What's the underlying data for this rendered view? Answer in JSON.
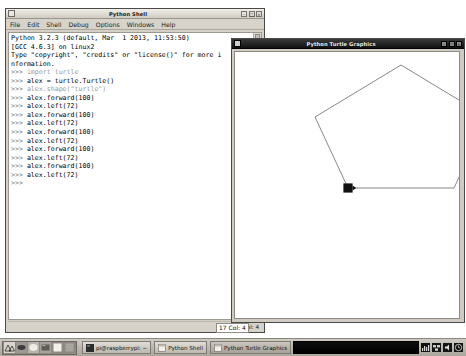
{
  "shell_window": {
    "title": "Python Shell",
    "sysmenu_icon": "window-menu-icon",
    "buttons": [
      {
        "name": "minimize-button",
        "glyph": "–"
      },
      {
        "name": "maximize-button",
        "glyph": "□"
      },
      {
        "name": "close-button",
        "glyph": "×"
      }
    ],
    "menus": [
      {
        "label": "File"
      },
      {
        "label": "Edit"
      },
      {
        "label": "Shell"
      },
      {
        "label": "Debug"
      },
      {
        "label": "Options"
      },
      {
        "label": "Windows"
      },
      {
        "label": "Help"
      }
    ],
    "console_lines": [
      "Python 3.2.3 (default, Mar  1 2013, 11:53:50)",
      "[GCC 4.6.3] on linux2",
      "Type \"copyright\", \"credits\" or \"license()\" for more i",
      "nformation.",
      ">>> import turtle",
      ">>> alex = turtle.Turtle()",
      ">>> alex.shape(\"turtle\")",
      ">>> alex.forward(100)",
      ">>> alex.left(72)",
      ">>> alex.forward(100)",
      ">>> alex.left(72)",
      ">>> alex.forward(100)",
      ">>> alex.left(72)",
      ">>> alex.forward(100)",
      ">>> alex.left(72)",
      ">>> alex.forward(100)",
      ">>> alex.left(72)",
      ">>> "
    ],
    "status": "Ln: 17 Col: 4"
  },
  "turtle_window": {
    "title": "Python Turtle Graphics",
    "sysmenu_icon": "window-menu-icon",
    "buttons": [
      {
        "name": "minimize-button",
        "glyph": "–"
      },
      {
        "name": "maximize-button",
        "glyph": "□"
      },
      {
        "name": "close-button",
        "glyph": "×"
      }
    ],
    "drawing": {
      "shape": "pentagon",
      "stroke_color": "#555555",
      "turtle_color": "#111111",
      "vertices": [
        {
          "x": 113,
          "y": 136
        },
        {
          "x": 219,
          "y": 136
        },
        {
          "x": 252,
          "y": 65
        },
        {
          "x": 166,
          "y": 13
        },
        {
          "x": 80,
          "y": 65
        }
      ],
      "turtle_position": {
        "x": 113,
        "y": 136
      },
      "turtle_heading_deg": 288
    }
  },
  "cursor_status": {
    "text": "17 Col: 4"
  },
  "taskbar": {
    "launcher_icons": [
      {
        "name": "menu-raspberry-icon",
        "color": "#cfcbc3"
      },
      {
        "name": "web-browser-icon",
        "color": "#6f6b64"
      },
      {
        "name": "file-manager-icon",
        "color": "#e8e4dc"
      },
      {
        "name": "terminal-icon",
        "color": "#7d7973"
      },
      {
        "name": "mathematica-icon",
        "color": "#f2efe8"
      },
      {
        "name": "wolfram-icon",
        "color": "#9a968f"
      }
    ],
    "tasks": [
      {
        "name": "taskbar-item-terminal",
        "label": "pi@raspberrypi: ~",
        "icon": "terminal-icon",
        "active": false
      },
      {
        "name": "taskbar-item-python-shell",
        "label": "Python Shell",
        "icon": "window-icon",
        "active": false
      },
      {
        "name": "taskbar-item-turtle-graphics",
        "label": "Python Turtle Graphics",
        "icon": "window-icon",
        "active": true
      }
    ],
    "tray": [
      {
        "name": "cpu-monitor-icon"
      },
      {
        "name": "network-icon"
      },
      {
        "name": "volume-icon"
      },
      {
        "name": "clock-icon"
      }
    ]
  }
}
